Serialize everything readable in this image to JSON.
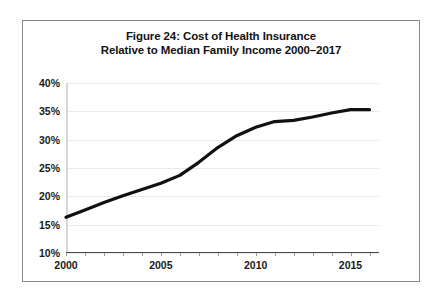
{
  "figure": {
    "border_color": "#8a8a8a",
    "background": "#ffffff"
  },
  "chart_data": {
    "type": "line",
    "title": "Figure 24: Cost of Health Insurance Relative to Median Family Income 2000–2017",
    "title_line1": "Figure 24: Cost of Health Insurance",
    "title_line2": "Relative to Median Family Income 2000–2017",
    "xlabel": "",
    "ylabel": "",
    "xlim": [
      2000,
      2016.5
    ],
    "ylim": [
      10,
      40
    ],
    "grid": true,
    "legend": "none",
    "line_color": "#111111",
    "x": [
      2000,
      2001,
      2002,
      2003,
      2004,
      2005,
      2006,
      2007,
      2008,
      2009,
      2010,
      2011,
      2012,
      2013,
      2014,
      2015,
      2016
    ],
    "values": [
      16.3,
      17.6,
      18.9,
      20.1,
      21.2,
      22.3,
      23.7,
      26.0,
      28.6,
      30.7,
      32.2,
      33.2,
      33.4,
      34.0,
      34.7,
      35.3,
      35.3
    ],
    "ytick_labels": [
      "40%",
      "35%",
      "30%",
      "25%",
      "20%",
      "15%",
      "10%"
    ],
    "ytick_values": [
      40,
      35,
      30,
      25,
      20,
      15,
      10
    ],
    "xtick_labels": [
      "2000",
      "2005",
      "2010",
      "2015"
    ],
    "xtick_values": [
      2000,
      2005,
      2010,
      2015
    ]
  }
}
